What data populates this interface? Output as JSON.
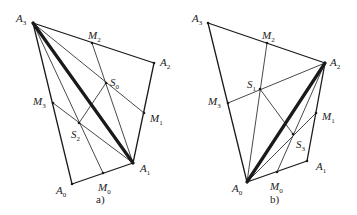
{
  "figure": {
    "panels": [
      {
        "id": "a",
        "caption": "a)",
        "points": {
          "A0": {
            "x": 72,
            "y": 184,
            "label": "A",
            "sub": "0",
            "lx": 56,
            "ly": 194
          },
          "A1": {
            "x": 133,
            "y": 163,
            "label": "A",
            "sub": "1",
            "lx": 140,
            "ly": 172
          },
          "A2": {
            "x": 154,
            "y": 63,
            "label": "A",
            "sub": "2",
            "lx": 160,
            "ly": 66
          },
          "A3": {
            "x": 33,
            "y": 23,
            "label": "A",
            "sub": "3",
            "lx": 16,
            "ly": 22
          },
          "M0": {
            "x": 103,
            "y": 173,
            "label": "M",
            "sub": "0",
            "lx": 98,
            "ly": 191
          },
          "M1": {
            "x": 144,
            "y": 113,
            "label": "M",
            "sub": "1",
            "lx": 150,
            "ly": 122
          },
          "M2": {
            "x": 92,
            "y": 43,
            "label": "M",
            "sub": "2",
            "lx": 88,
            "ly": 39
          },
          "M3": {
            "x": 53,
            "y": 103,
            "label": "M",
            "sub": "3",
            "lx": 33,
            "ly": 105
          },
          "S0": {
            "x": 106,
            "y": 83,
            "label": "S",
            "sub": "0",
            "lx": 110,
            "ly": 86
          },
          "S2": {
            "x": 79,
            "y": 123,
            "label": "S",
            "sub": "2",
            "lx": 71,
            "ly": 138
          }
        },
        "edges": [
          {
            "from": "A0",
            "to": "A1",
            "w": 1.3
          },
          {
            "from": "A1",
            "to": "A2",
            "w": 1.3
          },
          {
            "from": "A2",
            "to": "A3",
            "w": 1.3
          },
          {
            "from": "A3",
            "to": "A0",
            "w": 1.3
          },
          {
            "from": "A3",
            "to": "A1",
            "w": 3.2
          },
          {
            "from": "A3",
            "to": "M1",
            "w": 0.8
          },
          {
            "from": "A3",
            "to": "M0",
            "w": 0.8
          },
          {
            "from": "M2",
            "to": "A1",
            "w": 0.8
          },
          {
            "from": "M3",
            "to": "A1",
            "w": 0.8
          },
          {
            "from": "S0",
            "to": "S2",
            "w": 0.8
          }
        ],
        "caption_pos": {
          "x": 96,
          "y": 203
        }
      },
      {
        "id": "b",
        "caption": "b)",
        "points": {
          "A0": {
            "x": 247,
            "y": 182,
            "label": "A",
            "sub": "0",
            "lx": 232,
            "ly": 192
          },
          "A1": {
            "x": 307,
            "y": 161,
            "label": "A",
            "sub": "1",
            "lx": 316,
            "ly": 170
          },
          "A2": {
            "x": 325,
            "y": 63,
            "label": "A",
            "sub": "2",
            "lx": 330,
            "ly": 66
          },
          "A3": {
            "x": 208,
            "y": 23,
            "label": "A",
            "sub": "3",
            "lx": 192,
            "ly": 22
          },
          "M0": {
            "x": 277,
            "y": 172,
            "label": "M",
            "sub": "0",
            "lx": 270,
            "ly": 190
          },
          "M1": {
            "x": 316,
            "y": 113,
            "label": "M",
            "sub": "1",
            "lx": 322,
            "ly": 120
          },
          "M2": {
            "x": 267,
            "y": 43,
            "label": "M",
            "sub": "2",
            "lx": 262,
            "ly": 39
          },
          "M3": {
            "x": 228,
            "y": 103,
            "label": "M",
            "sub": "3",
            "lx": 208,
            "ly": 105
          },
          "S1": {
            "x": 260,
            "y": 89,
            "label": "S",
            "sub": "1",
            "lx": 247,
            "ly": 88
          },
          "S3": {
            "x": 293,
            "y": 134,
            "label": "S",
            "sub": "3",
            "lx": 296,
            "ly": 148
          }
        },
        "edges": [
          {
            "from": "A0",
            "to": "A1",
            "w": 1.3
          },
          {
            "from": "A1",
            "to": "A2",
            "w": 1.3
          },
          {
            "from": "A2",
            "to": "A3",
            "w": 1.3
          },
          {
            "from": "A3",
            "to": "A0",
            "w": 1.3
          },
          {
            "from": "A0",
            "to": "A2",
            "w": 3.2
          },
          {
            "from": "A2",
            "to": "M3",
            "w": 0.8
          },
          {
            "from": "A2",
            "to": "M0",
            "w": 0.8
          },
          {
            "from": "M2",
            "to": "A0",
            "w": 0.8
          },
          {
            "from": "M1",
            "to": "A0",
            "w": 0.8
          },
          {
            "from": "S1",
            "to": "S3",
            "w": 0.8
          }
        ],
        "caption_pos": {
          "x": 270,
          "y": 203
        }
      }
    ]
  }
}
